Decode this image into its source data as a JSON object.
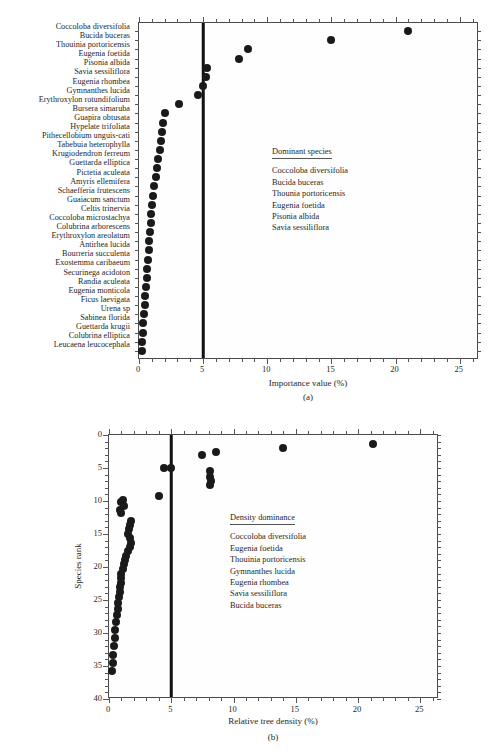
{
  "figure": {
    "panel_a_tag": "(a)",
    "panel_b_tag": "(b)"
  },
  "panel_a": {
    "xlabel": "Importance value (%)",
    "xticks": [
      "0",
      "5",
      "10",
      "15",
      "20",
      "25"
    ],
    "legend": {
      "title": "Dominant species",
      "items": [
        "Coccoloba diversifolia",
        "Bucida buceras",
        "Thounia portoricensis",
        "Eugenia foetida",
        "Pisonia albida",
        "Savia sessiliflora"
      ]
    },
    "species": [
      "Coccoloba diversifolia",
      "Bucida buceras",
      "Thouinia portoricensis",
      "Eugenia foetida",
      "Pisonia albida",
      "Savia sessiliflora",
      "Eugenia rhombea",
      "Gymnanthes lucida",
      "Erythroxylon rotundifolium",
      "Bursera simaruba",
      "Guapira obtusata",
      "Hypelate trifoliata",
      "Pithecellobium unguis-cati",
      "Tabebuia heterophylla",
      "Krugiodendron ferreum",
      "Guettarda elliptica",
      "Pictetia aculeata",
      "Amyris ellemifera",
      "Schaefferia frutescens",
      "Guaiacum sanctum",
      "Celtis trinervia",
      "Coccoloba microstachya",
      "Colubrina arborescens",
      "Erythroxylon areolatum",
      "Antirhea lucida",
      "Bourreria succulenta",
      "Exostemma caribaeum",
      "Securinega acidoton",
      "Randia aculeata",
      "Eugenia monticola",
      "Ficus laevigata",
      "Urena sp",
      "Sabinea florida",
      "Guettarda krugii",
      "Colubrina elliptica",
      "Leucaena leucocephala"
    ]
  },
  "panel_b": {
    "xlabel": "Relative tree density (%)",
    "ylabel": "Species rank",
    "xticks": [
      "0",
      "5",
      "10",
      "15",
      "20",
      "25"
    ],
    "yticks": [
      "0",
      "5",
      "10",
      "15",
      "20",
      "25",
      "30",
      "35",
      "40"
    ],
    "legend": {
      "title": "Density dominance",
      "items": [
        "Coccoloba diversifolia",
        "Eugenia foetida",
        "Thouinia portoricensis",
        "Gymnanthes lucida",
        "Eugenia rhombea",
        "Savia sessiliflora",
        "Bucida buceras"
      ]
    }
  },
  "chart_data": [
    {
      "type": "scatter",
      "title": "",
      "xlabel": "Importance value (%)",
      "ylabel": "",
      "xlim": [
        0,
        26.5
      ],
      "ylim": [
        0,
        37
      ],
      "grid": false,
      "reference_line_x": 5,
      "categories": [
        "Coccoloba diversifolia",
        "Bucida buceras",
        "Thouinia portoricensis",
        "Eugenia foetida",
        "Pisonia albida",
        "Savia sessiliflora",
        "Eugenia rhombea",
        "Gymnanthes lucida",
        "Erythroxylon rotundifolium",
        "Bursera simaruba",
        "Guapira obtusata",
        "Hypelate trifoliata",
        "Pithecellobium unguis-cati",
        "Tabebuia heterophylla",
        "Krugiodendron ferreum",
        "Guettarda elliptica",
        "Pictetia aculeata",
        "Amyris ellemifera",
        "Schaefferia frutescens",
        "Guaiacum sanctum",
        "Celtis trinervia",
        "Coccoloba microstachya",
        "Colubrina arborescens",
        "Erythroxylon areolatum",
        "Antirhea lucida",
        "Bourreria succulenta",
        "Exostemma caribaeum",
        "Securinega acidoton",
        "Randia aculeata",
        "Eugenia monticola",
        "Ficus laevigata",
        "Urena sp",
        "Sabinea florida",
        "Guettarda krugii",
        "Colubrina elliptica",
        "Leucaena leucocephala"
      ],
      "values": [
        21.0,
        15.0,
        8.5,
        7.8,
        5.3,
        5.2,
        5.0,
        4.6,
        3.1,
        2.0,
        1.9,
        1.8,
        1.7,
        1.6,
        1.5,
        1.4,
        1.3,
        1.2,
        1.1,
        1.0,
        0.95,
        0.9,
        0.85,
        0.8,
        0.75,
        0.7,
        0.65,
        0.6,
        0.55,
        0.5,
        0.45,
        0.4,
        0.35,
        0.3,
        0.25,
        0.2
      ]
    },
    {
      "type": "scatter",
      "title": "",
      "xlabel": "Relative tree density (%)",
      "ylabel": "Species rank",
      "xlim": [
        0,
        26.5
      ],
      "ylim": [
        0,
        40
      ],
      "y_inverted": true,
      "grid": false,
      "reference_line_x": 5,
      "x": [
        21.2,
        14.0,
        7.5,
        8.6,
        5.0,
        8.1,
        8.1,
        8.2,
        8.1,
        4.4,
        4.0,
        1.1,
        1.0,
        1.2,
        0.9,
        1.0,
        1.8,
        1.7,
        1.6,
        1.5,
        1.7,
        1.8,
        1.7,
        1.5,
        1.4,
        1.3,
        1.2,
        1.1,
        1.0,
        1.0,
        0.95,
        0.9,
        0.85,
        0.8,
        0.75,
        0.7,
        0.65,
        0.6,
        0.5,
        0.45,
        0.4,
        0.35,
        0.3,
        0.25
      ],
      "y": [
        1.3,
        2.0,
        3.0,
        2.5,
        5.0,
        5.5,
        6.3,
        7.0,
        7.6,
        5.0,
        9.2,
        9.8,
        10.2,
        10.8,
        11.3,
        11.8,
        13.0,
        13.6,
        14.3,
        15.0,
        15.6,
        16.3,
        17.0,
        17.6,
        18.3,
        19.0,
        19.6,
        20.3,
        21.0,
        21.7,
        22.4,
        23.1,
        23.8,
        24.6,
        25.4,
        26.3,
        27.3,
        28.4,
        29.6,
        30.8,
        32.0,
        33.3,
        34.5,
        35.8
      ]
    }
  ]
}
